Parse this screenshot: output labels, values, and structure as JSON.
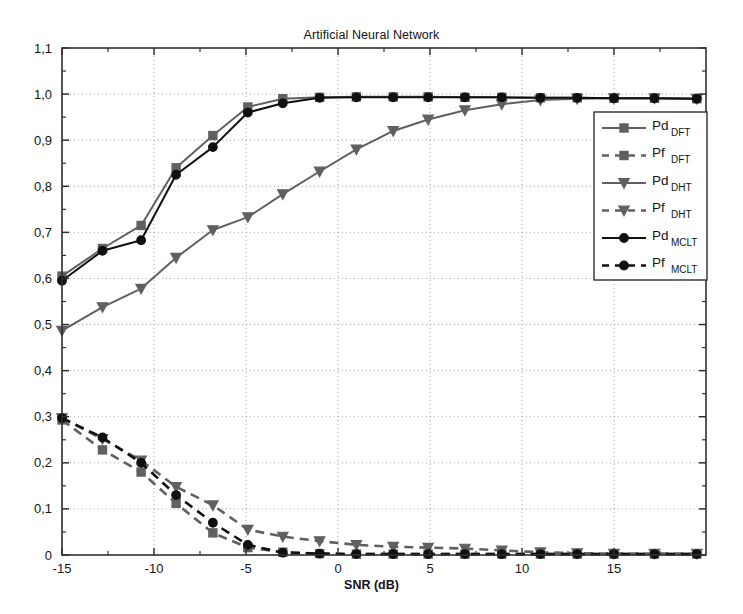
{
  "figure": {
    "title": "Artificial Neural Network",
    "xlabel": "SNR (dB)",
    "ylabel": ""
  },
  "axis": {
    "x_ticks": [
      "-15",
      "-10",
      "-5",
      "0",
      "5",
      "10",
      "15"
    ],
    "y_ticks": [
      "0",
      "0,1",
      "0,2",
      "0,3",
      "0,4",
      "0,5",
      "0,6",
      "0,7",
      "0,8",
      "0,9",
      "1,0",
      "1,1"
    ]
  },
  "legend": {
    "entries": [
      {
        "base": "Pd",
        "sub": "DFT",
        "style": "solid",
        "marker": "square",
        "color": "#606060"
      },
      {
        "base": "Pf",
        "sub": "DFT",
        "style": "dashed",
        "marker": "square",
        "color": "#606060"
      },
      {
        "base": "Pd",
        "sub": "DHT",
        "style": "solid",
        "marker": "triangle",
        "color": "#606060"
      },
      {
        "base": "Pf",
        "sub": "DHT",
        "style": "dashed",
        "marker": "triangle",
        "color": "#606060"
      },
      {
        "base": "Pd",
        "sub": "MCLT",
        "style": "solid",
        "marker": "circle",
        "color": "#101010"
      },
      {
        "base": "Pf",
        "sub": "MCLT",
        "style": "dashed",
        "marker": "circle",
        "color": "#101010"
      }
    ]
  },
  "chart_data": {
    "type": "line",
    "title": "Artificial Neural Network",
    "xlabel": "SNR (dB)",
    "ylabel": "",
    "xlim": [
      -15,
      20
    ],
    "ylim": [
      0,
      1.1
    ],
    "grid": true,
    "legend_position": "right",
    "x": [
      -15,
      -12.8,
      -10.7,
      -8.8,
      -6.8,
      -4.9,
      -3.0,
      -1.0,
      1.0,
      3.0,
      4.9,
      6.9,
      8.9,
      11.0,
      13.0,
      15.0,
      17.2,
      19.5
    ],
    "series": [
      {
        "name": "Pd_DFT",
        "label": "Pd DFT",
        "color": "#606060",
        "style": "solid",
        "marker": "square",
        "values": [
          0.605,
          0.665,
          0.715,
          0.84,
          0.91,
          0.972,
          0.99,
          0.993,
          0.994,
          0.994,
          0.994,
          0.993,
          0.993,
          0.992,
          0.992,
          0.991,
          0.991,
          0.99
        ]
      },
      {
        "name": "Pf_DFT",
        "label": "Pf DFT",
        "color": "#606060",
        "style": "dashed",
        "marker": "square",
        "values": [
          0.293,
          0.228,
          0.18,
          0.112,
          0.048,
          0.016,
          0.006,
          0.003,
          0.002,
          0.002,
          0.002,
          0.002,
          0.002,
          0.002,
          0.002,
          0.002,
          0.002,
          0.002
        ]
      },
      {
        "name": "Pd_DHT",
        "label": "Pd DHT",
        "color": "#606060",
        "style": "solid",
        "marker": "triangle",
        "values": [
          0.487,
          0.538,
          0.578,
          0.645,
          0.705,
          0.733,
          0.783,
          0.832,
          0.88,
          0.92,
          0.945,
          0.965,
          0.978,
          0.987,
          0.99,
          0.991,
          0.991,
          0.99
        ]
      },
      {
        "name": "Pf_DHT",
        "label": "Pf DHT",
        "color": "#606060",
        "style": "dashed",
        "marker": "triangle",
        "values": [
          0.297,
          0.252,
          0.205,
          0.148,
          0.108,
          0.055,
          0.04,
          0.03,
          0.022,
          0.018,
          0.016,
          0.014,
          0.01,
          0.006,
          0.004,
          0.003,
          0.003,
          0.003
        ]
      },
      {
        "name": "Pd_MCLT",
        "label": "Pd MCLT",
        "color": "#101010",
        "style": "solid",
        "marker": "circle",
        "values": [
          0.595,
          0.66,
          0.683,
          0.825,
          0.885,
          0.96,
          0.98,
          0.992,
          0.993,
          0.993,
          0.993,
          0.993,
          0.993,
          0.992,
          0.992,
          0.991,
          0.991,
          0.99
        ]
      },
      {
        "name": "Pf_MCLT",
        "label": "Pf MCLT",
        "color": "#101010",
        "style": "dashed",
        "marker": "circle",
        "values": [
          0.297,
          0.255,
          0.2,
          0.13,
          0.07,
          0.022,
          0.005,
          0.003,
          0.002,
          0.002,
          0.002,
          0.002,
          0.002,
          0.002,
          0.002,
          0.002,
          0.002,
          0.002
        ]
      }
    ]
  }
}
